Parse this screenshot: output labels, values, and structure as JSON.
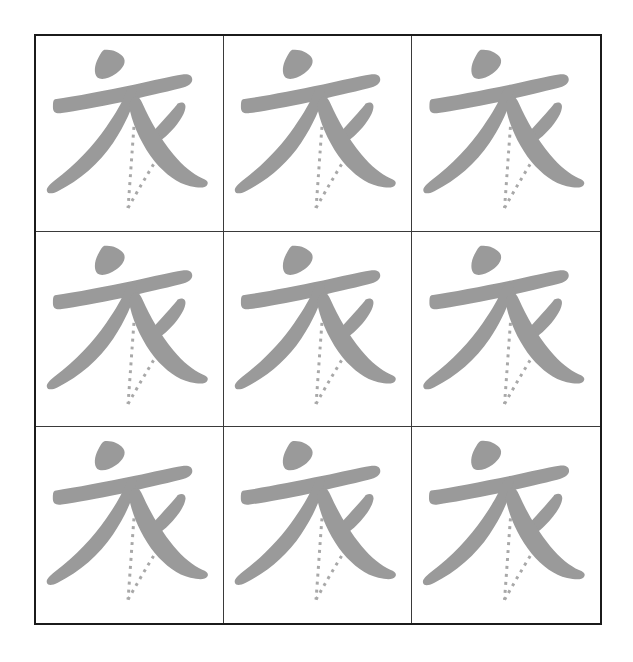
{
  "sheet": {
    "title": "Chinese Character Writing Practice Sheet",
    "character": "衣",
    "character_pinyin": "yī",
    "character_meaning": "clothing / garment",
    "background_color": "#ffffff",
    "page_width": 633,
    "page_height": 662
  },
  "grid": {
    "name": "character-practice-grid",
    "rows": 3,
    "columns": 3,
    "cell_count": 9,
    "outer_border_color": "#1b1b1b",
    "outer_border_width": 2,
    "inner_line_color": "#3a3a3a",
    "inner_line_width": 1,
    "left": 34,
    "top": 34,
    "width": 568,
    "height": 591,
    "cells": [
      {
        "id": "cell-1-1",
        "row": 1,
        "column": 1,
        "character": "衣"
      },
      {
        "id": "cell-1-2",
        "row": 1,
        "column": 2,
        "character": "衣"
      },
      {
        "id": "cell-1-3",
        "row": 1,
        "column": 3,
        "character": "衣"
      },
      {
        "id": "cell-2-1",
        "row": 2,
        "column": 1,
        "character": "衣"
      },
      {
        "id": "cell-2-2",
        "row": 2,
        "column": 2,
        "character": "衣"
      },
      {
        "id": "cell-2-3",
        "row": 2,
        "column": 3,
        "character": "衣"
      },
      {
        "id": "cell-3-1",
        "row": 3,
        "column": 1,
        "character": "衣"
      },
      {
        "id": "cell-3-2",
        "row": 3,
        "column": 2,
        "character": "衣"
      },
      {
        "id": "cell-3-3",
        "row": 3,
        "column": 3,
        "character": "衣"
      }
    ]
  },
  "glyph": {
    "solid_stroke_color": "#9a9a9a",
    "dashed_stroke_color": "#a8a8a8",
    "dash_pattern": "3 5",
    "dash_width": 3,
    "stroke_count_solid": 4,
    "stroke_count_dashed": 2,
    "strokes": [
      {
        "order": 1,
        "name": "dian-dot",
        "type": "solid"
      },
      {
        "order": 2,
        "name": "heng-horizontal",
        "type": "solid"
      },
      {
        "order": 3,
        "name": "pie-long-left-sweep",
        "type": "solid"
      },
      {
        "order": 4,
        "name": "shu-ti-short-right",
        "type": "solid"
      },
      {
        "order": 5,
        "name": "pie-guide-vertical",
        "type": "dashed"
      },
      {
        "order": 6,
        "name": "na-guide-diagonal",
        "type": "dashed"
      },
      {
        "order": 7,
        "name": "na-long-right-sweep",
        "type": "solid"
      }
    ]
  }
}
